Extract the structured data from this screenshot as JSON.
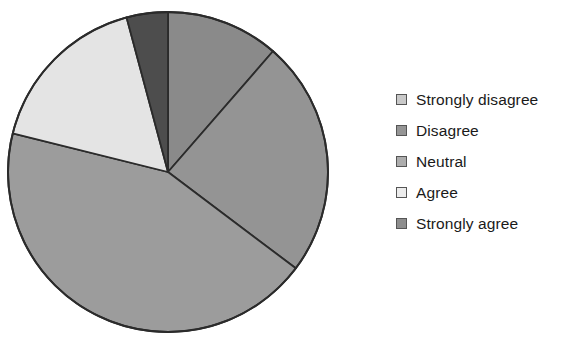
{
  "chart_data": {
    "type": "pie",
    "title": "",
    "subtitle": "",
    "xlabel": "",
    "ylabel": "",
    "grid": false,
    "legend_position": "right",
    "start_angle_deg": 0,
    "direction": "clockwise",
    "categories": [
      "Strongly disagree",
      "Disagree",
      "Neutral",
      "Agree",
      "Strongly agree"
    ],
    "values": [
      11.4,
      23.9,
      43.6,
      16.9,
      4.2
    ],
    "angles_deg": [
      41,
      86,
      157,
      61,
      15
    ],
    "colors": [
      "#8a8a8a",
      "#949494",
      "#9c9c9c",
      "#e4e4e4",
      "#4d4d4d"
    ],
    "slice_edge_color": "#2b2b2b",
    "slices": [
      {
        "label": "Strongly disagree",
        "value": 11.4,
        "angle_deg": 41,
        "color": "#8a8a8a"
      },
      {
        "label": "Disagree",
        "value": 23.9,
        "angle_deg": 86,
        "color": "#949494"
      },
      {
        "label": "Neutral",
        "value": 43.6,
        "angle_deg": 157,
        "color": "#9c9c9c"
      },
      {
        "label": "Agree",
        "value": 16.9,
        "angle_deg": 61,
        "color": "#e4e4e4"
      },
      {
        "label": "Strongly agree",
        "value": 4.2,
        "angle_deg": 15,
        "color": "#4d4d4d"
      }
    ],
    "geometry": {
      "cx": 168,
      "cy": 172,
      "r": 160
    }
  },
  "legend": {
    "items": [
      {
        "label": "Strongly disagree",
        "color": "#c9c9c9"
      },
      {
        "label": "Disagree",
        "color": "#959595"
      },
      {
        "label": "Neutral",
        "color": "#adadad"
      },
      {
        "label": "Agree",
        "color": "#ececec"
      },
      {
        "label": "Strongly agree",
        "color": "#8d8d8d"
      }
    ]
  }
}
